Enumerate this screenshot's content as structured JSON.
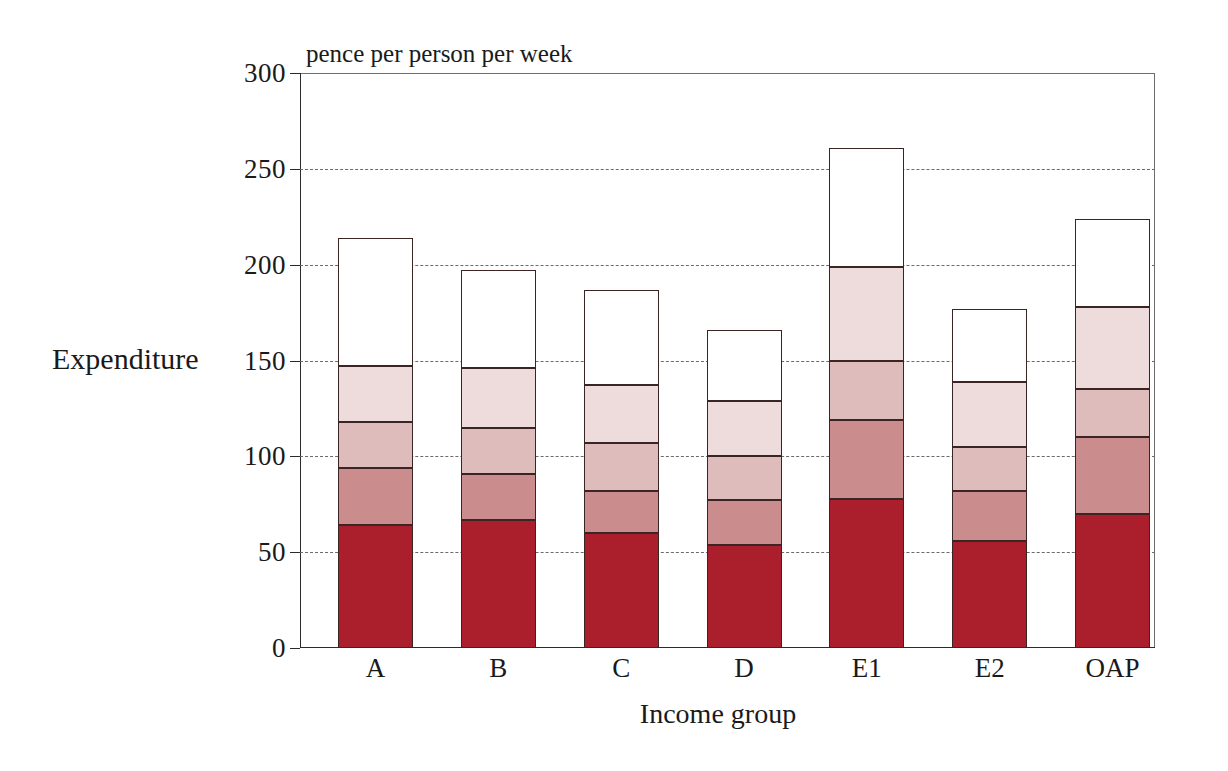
{
  "chart_data": {
    "type": "bar",
    "subtype": "stacked-bar",
    "title": "",
    "unit_title": "pence per person per week",
    "xlabel": "Income group",
    "ylabel": "Expenditure",
    "categories": [
      "A",
      "B",
      "C",
      "D",
      "E1",
      "E2",
      "OAP"
    ],
    "ylim": [
      0,
      300
    ],
    "yticks": [
      0,
      50,
      100,
      150,
      200,
      250,
      300
    ],
    "ytick_labels": [
      "0",
      "50",
      "100",
      "150",
      "200",
      "250",
      "300"
    ],
    "grid": true,
    "grid_style": "dashed",
    "grid_axis": "y",
    "legend": "none",
    "series": [
      {
        "name": "segment-1",
        "color": "#ab1f2c",
        "values": [
          64,
          67,
          60,
          54,
          78,
          56,
          70
        ]
      },
      {
        "name": "segment-2",
        "color": "#ca8c8c",
        "values": [
          30,
          24,
          22,
          23,
          41,
          26,
          40
        ]
      },
      {
        "name": "segment-3",
        "color": "#debcbc",
        "values": [
          24,
          24,
          25,
          23,
          31,
          23,
          25
        ]
      },
      {
        "name": "segment-4",
        "color": "#eedcdc",
        "values": [
          29,
          31,
          30,
          29,
          49,
          34,
          43
        ]
      },
      {
        "name": "segment-5",
        "color": "#ffffff",
        "values": [
          67,
          51,
          50,
          37,
          62,
          38,
          46
        ]
      }
    ],
    "totals": [
      214,
      197,
      187,
      166,
      261,
      177,
      224
    ],
    "cumulative": [
      [
        64,
        94,
        118,
        147,
        214
      ],
      [
        67,
        91,
        115,
        146,
        197
      ],
      [
        60,
        82,
        107,
        137,
        187
      ],
      [
        54,
        77,
        100,
        129,
        166
      ],
      [
        78,
        119,
        150,
        199,
        261
      ],
      [
        56,
        82,
        105,
        139,
        177
      ],
      [
        70,
        110,
        135,
        178,
        224
      ]
    ]
  },
  "colors": {
    "segment_1": "#ab1f2c",
    "segment_2": "#ca8c8c",
    "segment_3": "#debcbc",
    "segment_4": "#eedcdc",
    "segment_5": "#ffffff",
    "segment_border": "#3a2424",
    "axis": "#2b2b2b",
    "grid": "#6b6b6b",
    "text": "#1a1a1a",
    "background": "#ffffff"
  }
}
